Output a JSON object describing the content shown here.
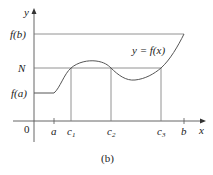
{
  "figure": {
    "caption": "(b)",
    "curve_label": "y = f(x)",
    "axes": {
      "x_label": "x",
      "y_label": "y",
      "origin_label": "0"
    },
    "y_ticks": [
      {
        "label": "f(b)",
        "key": "fb"
      },
      {
        "label": "N",
        "key": "N"
      },
      {
        "label": "f(a)",
        "key": "fa"
      }
    ],
    "x_ticks": [
      {
        "label": "a"
      },
      {
        "label": "c",
        "sub": "1"
      },
      {
        "label": "c",
        "sub": "2"
      },
      {
        "label": "c",
        "sub": "3"
      },
      {
        "label": "b"
      }
    ],
    "colors": {
      "line": "#555555",
      "text": "#222222",
      "background": "#ffffff"
    }
  }
}
